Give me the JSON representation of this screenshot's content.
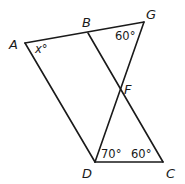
{
  "diagram": {
    "points": {
      "A": {
        "label": "A",
        "x": 25,
        "y": 43
      },
      "B": {
        "label": "B",
        "x": 88,
        "y": 33
      },
      "G": {
        "label": "G",
        "x": 144,
        "y": 22
      },
      "F": {
        "label": "F",
        "x": 121,
        "y": 88
      },
      "D": {
        "label": "D",
        "x": 95,
        "y": 162
      },
      "C": {
        "label": "C",
        "x": 163,
        "y": 162
      }
    },
    "segments": [
      {
        "from": "A",
        "to": "G"
      },
      {
        "from": "A",
        "to": "D"
      },
      {
        "from": "B",
        "to": "C"
      },
      {
        "from": "G",
        "to": "D"
      },
      {
        "from": "D",
        "to": "C"
      }
    ],
    "angles": {
      "A": {
        "label": "x°"
      },
      "G": {
        "label": "60°"
      },
      "D": {
        "label": "70°"
      },
      "C": {
        "label": "60°"
      }
    }
  }
}
